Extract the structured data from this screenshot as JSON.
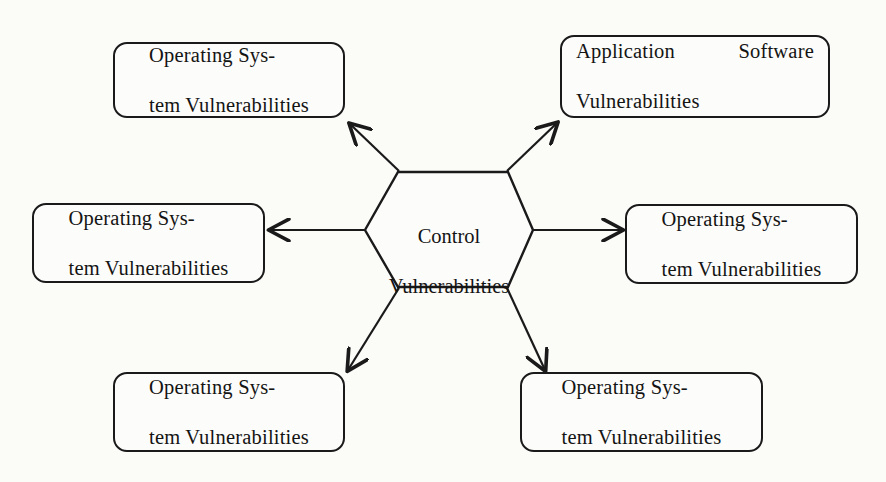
{
  "diagram": {
    "background_color": "#fbfbf8",
    "line_color": "#1a1a1a",
    "text_color": "#141414",
    "hub": {
      "shape": "hexagon",
      "label": "Control\nVulnerabilities",
      "label_line1": "Control",
      "label_line2": "Vulnerabilities"
    },
    "nodes": [
      {
        "id": "top-left",
        "label": "Operating Sys-\ntem Vulnerabilities",
        "line1": "Operating Sys-",
        "line2": "tem Vulnerabilities",
        "align": "center"
      },
      {
        "id": "top-right",
        "label": "Application Software\nVulnerabilities",
        "line1": "Application Software",
        "line2": "Vulnerabilities",
        "align": "justify"
      },
      {
        "id": "left",
        "label": "Operating Sys-\ntem Vulnerabilities",
        "line1": "Operating Sys-",
        "line2": "tem Vulnerabilities",
        "align": "center"
      },
      {
        "id": "right",
        "label": "Operating Sys-\ntem Vulnerabilities",
        "line1": "Operating Sys-",
        "line2": "tem Vulnerabilities",
        "align": "center"
      },
      {
        "id": "bottom-left",
        "label": "Operating Sys-\ntem Vulnerabilities",
        "line1": "Operating Sys-",
        "line2": "tem Vulnerabilities",
        "align": "center"
      },
      {
        "id": "bottom-right",
        "label": "Operating Sys-\ntem Vulnerabilities",
        "line1": "Operating Sys-",
        "line2": "tem Vulnerabilities",
        "align": "center"
      }
    ],
    "connectors": [
      {
        "id": "hub-to-top-left",
        "from": "hub",
        "to": "top-left",
        "arrowhead": "to-node"
      },
      {
        "id": "hub-to-top-right",
        "from": "hub",
        "to": "top-right",
        "arrowhead": "to-node"
      },
      {
        "id": "hub-to-left",
        "from": "hub",
        "to": "left",
        "arrowhead": "to-node"
      },
      {
        "id": "hub-to-right",
        "from": "hub",
        "to": "right",
        "arrowhead": "to-node"
      },
      {
        "id": "hub-to-bottom-left",
        "from": "hub",
        "to": "bottom-left",
        "arrowhead": "to-node"
      },
      {
        "id": "hub-to-bottom-right",
        "from": "hub",
        "to": "bottom-right",
        "arrowhead": "to-node"
      }
    ]
  }
}
